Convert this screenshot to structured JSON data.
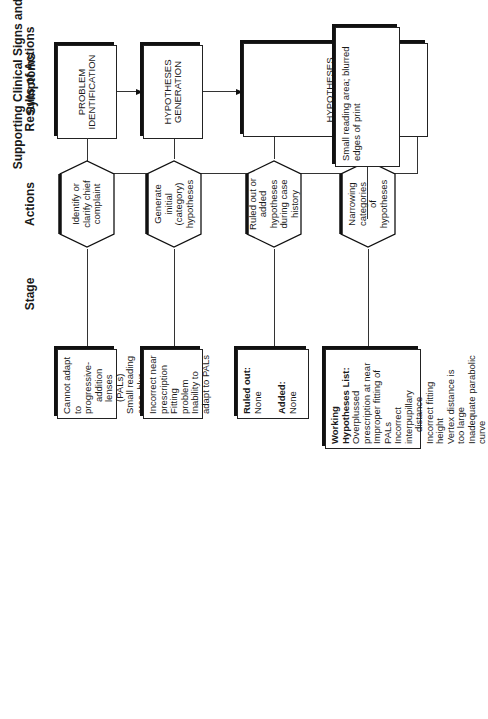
{
  "headers": {
    "stage": "Stage",
    "actions": "Actions",
    "results": "Results of Actions",
    "supporting": "Supporting Clinical Signs and Symptoms"
  },
  "stages": [
    {
      "label": "PROBLEM IDENTIFICATION"
    },
    {
      "label": "HYPOTHESES GENERATION"
    },
    {
      "label": "HYPOTHESES TESTING"
    }
  ],
  "case_history": "CASE HISTORY",
  "actions": [
    {
      "label": "Identify or clarify chief complaint"
    },
    {
      "label": "Generate initial (category) hypotheses"
    },
    {
      "label": "Ruled out or added hypotheses during case history"
    },
    {
      "label": "Narrowing categories of hypotheses"
    }
  ],
  "results": [
    {
      "lines": [
        "Cannot adapt to progressive-",
        "addition lenses (PALs)",
        "Small reading area, blur around",
        "edges of near print"
      ]
    },
    {
      "lines": [
        "Incorrect near prescription",
        "Fitting problem",
        "Inability to adapt to PALs"
      ]
    },
    {
      "ruled_out_label": "Ruled out:",
      "ruled_out_value": "None",
      "added_label": "Added:",
      "added_value": "None"
    },
    {
      "title": "Working Hypotheses List:",
      "lines": [
        "Overplussed prescription at near",
        "Improper fitting of PALs",
        "Incorrect interpupillary",
        "distance",
        "Incorrect fitting height",
        "Vertex distance is too large",
        "Inadequate parabolic curve"
      ]
    }
  ],
  "supporting": {
    "text": "Small reading area; blurred edges of print"
  }
}
